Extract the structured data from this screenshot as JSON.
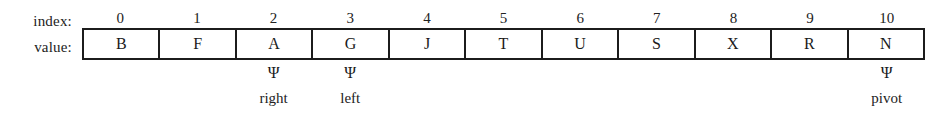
{
  "figure": {
    "type": "array-diagram",
    "row_labels": {
      "index": "index:",
      "value": "value:"
    },
    "indices": [
      "0",
      "1",
      "2",
      "3",
      "4",
      "5",
      "6",
      "7",
      "8",
      "9",
      "10"
    ],
    "values": [
      "B",
      "F",
      "A",
      "G",
      "J",
      "T",
      "U",
      "S",
      "X",
      "R",
      "N"
    ],
    "pointer_marker": "Ψ",
    "pointers": [
      {
        "index": 2,
        "label": "right"
      },
      {
        "index": 3,
        "label": "left"
      },
      {
        "index": 10,
        "label": "pivot"
      }
    ],
    "colors": {
      "background": "#ffffff",
      "border": "#1c1c1c",
      "text": "#1a1a1a"
    }
  }
}
